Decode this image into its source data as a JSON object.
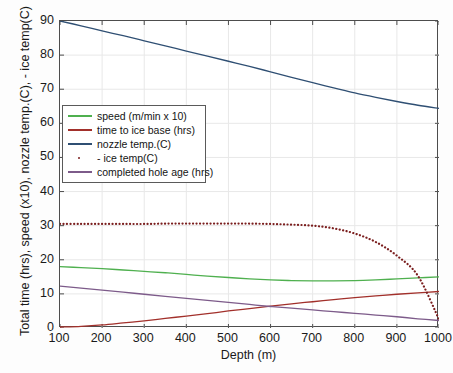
{
  "chart_data": {
    "type": "line",
    "title": "",
    "xlabel": "Depth (m)",
    "ylabel": "Total time (hrs), speed (x10), nozzle temp.(C), - ice temp(C)",
    "xlim": [
      100,
      1000
    ],
    "ylim": [
      0,
      90
    ],
    "xticks": [
      100,
      200,
      300,
      400,
      500,
      600,
      700,
      800,
      900,
      1000
    ],
    "yticks": [
      0,
      10,
      20,
      30,
      40,
      50,
      60,
      70,
      80,
      90
    ],
    "grid": true,
    "legend_position": "upper-left",
    "x": [
      100,
      150,
      200,
      250,
      300,
      350,
      400,
      450,
      500,
      550,
      600,
      650,
      700,
      750,
      800,
      850,
      900,
      950,
      1000
    ],
    "series": [
      {
        "name": "speed (m/min x 10)",
        "color": "#4fb04f",
        "style": "solid",
        "values": [
          18.0,
          17.7,
          17.4,
          17.0,
          16.6,
          16.2,
          15.7,
          15.2,
          14.8,
          14.4,
          14.1,
          13.9,
          13.8,
          13.8,
          13.9,
          14.1,
          14.4,
          14.7,
          15.0
        ]
      },
      {
        "name": "time to ice base (hrs)",
        "color": "#a2302b",
        "style": "solid",
        "values": [
          0.3,
          0.5,
          0.9,
          1.5,
          2.1,
          2.8,
          3.5,
          4.2,
          5.0,
          5.7,
          6.4,
          7.1,
          7.7,
          8.3,
          8.9,
          9.4,
          9.9,
          10.3,
          10.7
        ]
      },
      {
        "name": "nozzle temp.(C)",
        "color": "#2f4f73",
        "style": "solid",
        "values": [
          90.0,
          88.6,
          87.1,
          85.7,
          84.2,
          82.7,
          81.2,
          79.7,
          78.2,
          76.7,
          75.1,
          73.5,
          71.9,
          70.4,
          68.9,
          67.6,
          66.4,
          65.3,
          64.4
        ]
      },
      {
        "name": "- ice temp(C)",
        "color": "#7b1f1f",
        "style": "dotted",
        "values": [
          30.5,
          30.5,
          30.5,
          30.5,
          30.5,
          30.6,
          30.6,
          30.6,
          30.6,
          30.6,
          30.5,
          30.3,
          30.0,
          29.2,
          27.7,
          25.2,
          21.2,
          15.3,
          2.5
        ]
      },
      {
        "name": "completed hole age (hrs)",
        "color": "#7d5b8a",
        "style": "solid",
        "values": [
          12.3,
          11.7,
          11.1,
          10.5,
          9.9,
          9.3,
          8.7,
          8.1,
          7.5,
          6.9,
          6.3,
          5.8,
          5.3,
          4.8,
          4.3,
          3.8,
          3.3,
          2.7,
          2.2
        ]
      }
    ]
  },
  "legend": {
    "items": [
      {
        "label": "speed (m/min x 10)",
        "color": "#4fb04f",
        "style": "solid"
      },
      {
        "label": "time to ice base (hrs)",
        "color": "#a2302b",
        "style": "solid"
      },
      {
        "label": "nozzle temp.(C)",
        "color": "#2f4f73",
        "style": "solid"
      },
      {
        "label": "- ice temp(C)",
        "color": "#7b1f1f",
        "style": "dotted"
      },
      {
        "label": "completed hole age (hrs)",
        "color": "#7d5b8a",
        "style": "solid"
      }
    ]
  },
  "axes": {
    "x_title": "Depth (m)",
    "y_title": "Total time (hrs), speed (x10), nozzle temp.(C), - ice temp(C)"
  },
  "colors": {
    "axis": "#4d4d4d",
    "grid": "#e8e8e8",
    "text": "#1a1a1a",
    "background": "#ffffff"
  }
}
